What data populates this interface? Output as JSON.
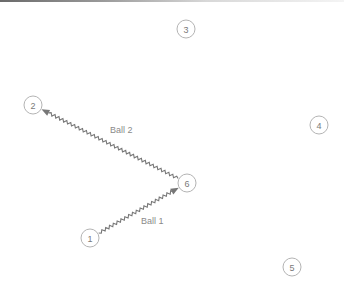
{
  "diagram": {
    "colors": {
      "background": "#ffffff",
      "node_stroke": "#b4b4b4",
      "node_text": "#7a7a7a",
      "arrow": "#777777",
      "label": "#8a8a8a"
    },
    "nodes": [
      {
        "id": "1",
        "label": "1",
        "x": 90,
        "y": 238
      },
      {
        "id": "2",
        "label": "2",
        "x": 33,
        "y": 105
      },
      {
        "id": "3",
        "label": "3",
        "x": 186,
        "y": 29
      },
      {
        "id": "4",
        "label": "4",
        "x": 319,
        "y": 125
      },
      {
        "id": "5",
        "label": "5",
        "x": 292,
        "y": 267
      },
      {
        "id": "6",
        "label": "6",
        "x": 187,
        "y": 183
      }
    ],
    "edges": [
      {
        "id": "ball1",
        "from": "1",
        "to": "6",
        "label": "Ball 1",
        "label_x": 141,
        "label_y": 224
      },
      {
        "id": "ball2",
        "from": "6",
        "to": "2",
        "label": "Ball 2",
        "label_x": 110,
        "label_y": 133
      }
    ]
  }
}
